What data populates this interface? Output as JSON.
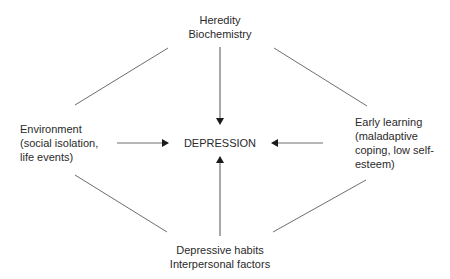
{
  "diagram": {
    "title": "",
    "nodes": {
      "top": {
        "lines": [
          "Heredity",
          "Biochemistry"
        ]
      },
      "left": {
        "lines": [
          "Environment",
          "(social isolation,",
          "life events)"
        ]
      },
      "center": {
        "lines": [
          "DEPRESSION"
        ]
      },
      "right": {
        "lines": [
          "Early learning",
          "(maladaptive",
          "coping, low self-",
          "esteem)"
        ]
      },
      "bottom": {
        "lines": [
          "Depressive habits",
          "Interpersonal factors"
        ]
      }
    },
    "edges": [
      {
        "from": "top",
        "to": "center",
        "type": "arrow"
      },
      {
        "from": "left",
        "to": "center",
        "type": "arrow"
      },
      {
        "from": "right",
        "to": "center",
        "type": "arrow"
      },
      {
        "from": "bottom",
        "to": "center",
        "type": "arrow"
      },
      {
        "from": "top",
        "to": "left",
        "type": "line"
      },
      {
        "from": "top",
        "to": "right",
        "type": "line"
      },
      {
        "from": "bottom",
        "to": "left",
        "type": "line"
      },
      {
        "from": "bottom",
        "to": "right",
        "type": "line"
      }
    ],
    "colors": {
      "text": "#2a2a2a",
      "line": "#6e6e6e",
      "arrowhead": "#1a1a1a",
      "background": "#ffffff"
    }
  }
}
